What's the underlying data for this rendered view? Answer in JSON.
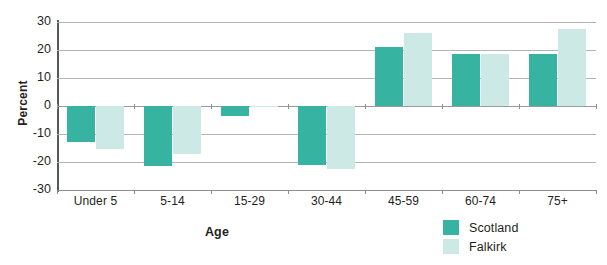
{
  "chart_data": {
    "type": "bar",
    "title": "",
    "xlabel": "Age",
    "ylabel": "Percent",
    "categories": [
      "Under 5",
      "5-14",
      "15-29",
      "30-44",
      "45-59",
      "60-74",
      "75+"
    ],
    "series": [
      {
        "name": "Scotland",
        "color": "#36b3a1",
        "values": [
          -13,
          -21.5,
          -3.5,
          -21,
          21,
          18.5,
          18.5
        ]
      },
      {
        "name": "Falkirk",
        "color": "#cde9e6",
        "values": [
          -15.5,
          -17,
          -0.5,
          -22.5,
          26,
          18.5,
          27.5
        ]
      }
    ],
    "ylim": [
      -30,
      30
    ],
    "yticks": [
      "30",
      "20",
      "10",
      "0",
      "-10",
      "-20",
      "-30"
    ],
    "ytick_values": [
      30,
      20,
      10,
      0,
      -10,
      -20,
      -30
    ],
    "grid": true,
    "legend_position": "bottom-right"
  },
  "axis": {
    "y_title": "Percent",
    "x_title": "Age"
  },
  "legend": {
    "items": [
      {
        "label": "Scotland",
        "swatch": "scotland"
      },
      {
        "label": "Falkirk",
        "swatch": "falkirk"
      }
    ]
  },
  "title_remnant": ""
}
